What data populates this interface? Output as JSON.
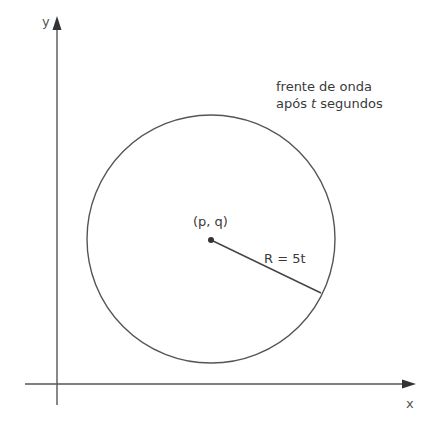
{
  "diagram": {
    "axes": {
      "x_label": "x",
      "y_label": "y"
    },
    "circle": {
      "center_label": "(p, q)",
      "radius_label": "R = 5t"
    },
    "annotation": {
      "line1": "frente de onda",
      "line2_prefix": "após ",
      "line2_var": "t",
      "line2_suffix": " segundos"
    },
    "colors": {
      "stroke": "#555555",
      "text": "#3a3a3a",
      "background": "#ffffff"
    }
  }
}
